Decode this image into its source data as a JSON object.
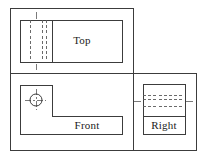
{
  "drawing": {
    "title": "Orthographic Projection — Three View Layout",
    "background_color": "#ffffff",
    "line_color": "#3c3c3c",
    "hidden_line_color": "#5a5a5a",
    "center_line_color": "#6b6b6b",
    "text_color": "#1a1a1a",
    "frame": {
      "name": "outer-frame",
      "x": 10,
      "y": 8,
      "width": 186,
      "height": 142,
      "divider_horizontal_y": 73,
      "divider_vertical_x": 133,
      "top_row_right_edge_x": 133,
      "bottom_row_right_edge_x": 196
    },
    "views": [
      {
        "id": "top",
        "label": "Top",
        "quadrant": "upper-left",
        "outline": {
          "x": 20,
          "y": 20,
          "width": 102,
          "height": 42
        },
        "label_x": 82,
        "label_y": 41,
        "solid_divider_x": 52,
        "hidden_lines_x": [
          30,
          38,
          46
        ],
        "center_line_x": 36,
        "center_line_top": 12,
        "center_line_bottom": 70
      },
      {
        "id": "front",
        "label": "Front",
        "quadrant": "lower-left",
        "outline_points": "20,85 52,85 52,116 122,116 122,134 20,134",
        "label_x": 87,
        "label_y": 126,
        "circle": {
          "cx": 36,
          "cy": 100,
          "r": 6
        },
        "circle_center_marks": {
          "h_half": 11,
          "v_half": 11
        }
      },
      {
        "id": "right",
        "label": "Right",
        "quadrant": "lower-right",
        "outline": {
          "x": 143,
          "y": 84,
          "width": 42,
          "height": 50
        },
        "label_x": 164,
        "label_y": 126,
        "solid_divider_y": 116,
        "hidden_lines_y": [
          94,
          101,
          108
        ],
        "center_line_y": 101,
        "center_line_left": 134,
        "center_line_right": 194
      }
    ],
    "line_styles": {
      "visible": "solid",
      "hidden": "dashed",
      "center": "dash-dot"
    }
  }
}
